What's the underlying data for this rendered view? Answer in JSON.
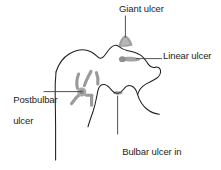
{
  "figure": {
    "background_color": "#ffffff",
    "outline_color": "#231f20",
    "leader_color": "#4a4a4a",
    "ulcer_fill_color": "#9a9a9a",
    "ulcer_fill_light": "#b5b5b5",
    "text_color": "#1d1d1d"
  },
  "labels": {
    "giant_ulcer": "Giant ulcer",
    "linear_ulcer": "Linear ulcer",
    "postbulbar_ulcer_line1": "Postbulbar",
    "postbulbar_ulcer_line2": "ulcer",
    "bulbar_ulcer_line1": "Bulbar ulcer in",
    "bulbar_ulcer_line2": "profile"
  },
  "annotations": [
    {
      "name": "giant-ulcer",
      "label": "Giant ulcer",
      "marker": "filled-triangular-niche",
      "position": "superior bulb apex",
      "leader": "vertical"
    },
    {
      "name": "linear-ulcer",
      "label": "Linear ulcer",
      "marker": "horizontal-grey-streak",
      "position": "anterior bulb wall",
      "leader": "horizontal"
    },
    {
      "name": "postbulbar-ulcer",
      "label": "Postbulbar ulcer",
      "marker": "radiating-fold-starburst",
      "position": "postbulbar duodenum",
      "leader": "horizontal"
    },
    {
      "name": "bulbar-ulcer-in-profile",
      "label": "Bulbar ulcer in profile",
      "marker": "small-grey-blob",
      "position": "inferior bulb notch",
      "leader": "vertical"
    }
  ]
}
